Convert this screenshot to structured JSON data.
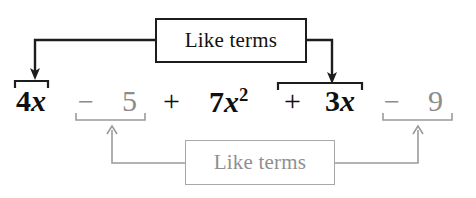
{
  "diagram": {
    "colors": {
      "dark": "#101010",
      "gray": "#8c8c8c",
      "gray_border": "#a8a8a8",
      "background": "#ffffff"
    },
    "boxes": {
      "top": {
        "label": "Like terms",
        "style": "dark"
      },
      "bottom": {
        "label": "Like terms",
        "style": "gray"
      }
    },
    "expression": {
      "terms": [
        {
          "id": "4x",
          "text": "4x",
          "coefficient": "4",
          "variable": "x",
          "exponent": "",
          "style": "dark"
        },
        {
          "id": "min5",
          "text": "−",
          "style": "gray"
        },
        {
          "id": "5",
          "text": "5",
          "style": "gray"
        },
        {
          "id": "plus1",
          "text": "+",
          "style": "dark"
        },
        {
          "id": "7x2",
          "text": "7x",
          "coefficient": "7",
          "variable": "x",
          "exponent": "2",
          "style": "dark"
        },
        {
          "id": "plus2",
          "text": "+",
          "style": "dark"
        },
        {
          "id": "3x",
          "text": "3x",
          "coefficient": "3",
          "variable": "x",
          "exponent": "",
          "style": "dark"
        },
        {
          "id": "min9",
          "text": "−",
          "style": "gray"
        },
        {
          "id": "9",
          "text": "9",
          "style": "gray"
        }
      ],
      "full_text": "4x − 5 + 7x² + 3x − 9"
    },
    "parts": {
      "four_x_coefficient": "4",
      "four_x_variable": "x",
      "minus_five_sign": "−",
      "five": "5",
      "plus_one": "+",
      "seven_x_coefficient": "7",
      "seven_x_variable": "x",
      "seven_x_exponent": "2",
      "plus_two": "+",
      "three_x_coefficient": "3",
      "three_x_variable": "x",
      "minus_nine_sign": "−",
      "nine": "9"
    },
    "groupings": [
      {
        "name": "top-group-left",
        "terms": [
          "4x"
        ],
        "bracket": "above",
        "style": "dark"
      },
      {
        "name": "top-group-right",
        "terms": [
          "+",
          "3x"
        ],
        "bracket": "above",
        "style": "dark"
      },
      {
        "name": "bottom-group-left",
        "terms": [
          "−",
          "5"
        ],
        "bracket": "below",
        "style": "gray"
      },
      {
        "name": "bottom-group-right",
        "terms": [
          "−",
          "9"
        ],
        "bracket": "below",
        "style": "gray"
      }
    ]
  }
}
